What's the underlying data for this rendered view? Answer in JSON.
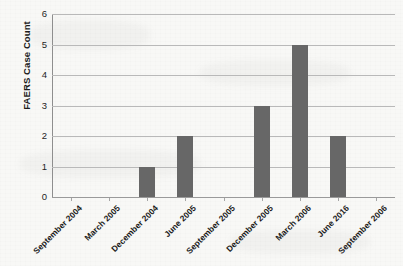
{
  "chart_data": {
    "type": "bar",
    "title": "",
    "xlabel": "",
    "ylabel": "FAERS Case Count",
    "ylim": [
      0,
      6
    ],
    "ytick_labels": [
      "0",
      "1",
      "2",
      "3",
      "4",
      "5",
      "6"
    ],
    "ytick_values": [
      0,
      1,
      2,
      3,
      4,
      5,
      6
    ],
    "grid": true,
    "legend": false,
    "categories": [
      "September 2004",
      "March 2005",
      "December 2004",
      "June 2005",
      "September 2005",
      "December 2005",
      "March 2006",
      "June 2016",
      "September 2006"
    ],
    "values": [
      0,
      0,
      1,
      2,
      0,
      3,
      5,
      2,
      0
    ],
    "series": [
      {
        "name": "FAERS Case Count",
        "values": [
          0,
          0,
          1,
          2,
          0,
          3,
          5,
          2,
          0
        ],
        "color": "#676767"
      }
    ]
  },
  "colors": {
    "bar": "#676767",
    "gridline": "#b9b9b9",
    "axis": "#8e8e8e",
    "text": "#1a1a1a",
    "background": "#f8f8f6"
  }
}
